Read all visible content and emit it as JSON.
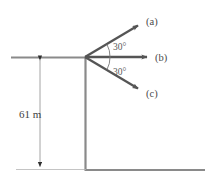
{
  "figure": {
    "type": "physics-projectile-cliff-diagram",
    "background_color": "#ffffff",
    "line_color": "#555555",
    "terrain_color": "#7a7a7a",
    "dimension_color": "#3f3f3f"
  },
  "vectors": [
    {
      "id": "a",
      "label": "(a)",
      "direction": "up-right",
      "angle_deg": 30,
      "angle_from": "horizontal-above",
      "origin": {
        "x": 85,
        "y": 57
      },
      "tip": {
        "x": 142,
        "y": 23
      },
      "label_pos": {
        "x": 146,
        "y": 22
      }
    },
    {
      "id": "b",
      "label": "(b)",
      "direction": "right",
      "angle_deg": 0,
      "angle_from": "horizontal",
      "origin": {
        "x": 85,
        "y": 57
      },
      "tip": {
        "x": 152,
        "y": 57
      },
      "label_pos": {
        "x": 156,
        "y": 57
      }
    },
    {
      "id": "c",
      "label": "(c)",
      "direction": "down-right",
      "angle_deg": 30,
      "angle_from": "horizontal-below",
      "origin": {
        "x": 85,
        "y": 57
      },
      "tip": {
        "x": 142,
        "y": 91
      },
      "label_pos": {
        "x": 146,
        "y": 94
      }
    }
  ],
  "angles": [
    {
      "id": "upper",
      "label": "30°",
      "value": 30,
      "unit": "degrees",
      "label_pos": {
        "x": 111,
        "y": 49
      }
    },
    {
      "id": "lower",
      "label": "30°",
      "value": 30,
      "unit": "degrees",
      "label_pos": {
        "x": 111,
        "y": 72
      }
    }
  ],
  "dimension": {
    "label": "61 m",
    "value": 61,
    "unit": "m",
    "measures": "cliff-height",
    "top_y": 57,
    "bottom_y": 169,
    "line_x": 40,
    "label_pos": {
      "x": 33,
      "y": 114
    }
  },
  "terrain": {
    "top_ground": {
      "x1": 11,
      "x2": 85,
      "y": 57
    },
    "cliff_wall": {
      "x": 85,
      "y1": 57,
      "y2": 170
    },
    "bottom_ground": {
      "x1": 85,
      "x2": 205,
      "y": 170
    }
  }
}
